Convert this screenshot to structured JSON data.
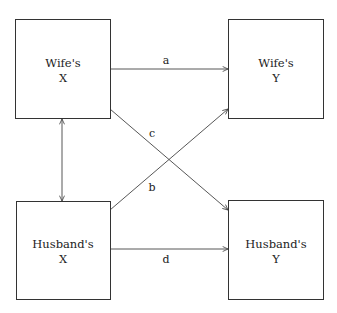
{
  "diagram": {
    "nodes": [
      {
        "id": "wife_x",
        "line1": "Wife's",
        "line2": "X"
      },
      {
        "id": "wife_y",
        "line1": "Wife's",
        "line2": "Y"
      },
      {
        "id": "husband_x",
        "line1": "Husband's",
        "line2": "X"
      },
      {
        "id": "husband_y",
        "line1": "Husband's",
        "line2": "Y"
      }
    ],
    "edges": [
      {
        "id": "a",
        "label": "a",
        "from": "wife_x",
        "to": "wife_y"
      },
      {
        "id": "c",
        "label": "c",
        "from": "wife_x",
        "to": "husband_y"
      },
      {
        "id": "b",
        "label": "b",
        "from": "husband_x",
        "to": "wife_y"
      },
      {
        "id": "d",
        "label": "d",
        "from": "husband_x",
        "to": "husband_y"
      },
      {
        "id": "corr",
        "label": "",
        "from": "wife_x",
        "to": "husband_x",
        "bidirectional": true
      }
    ]
  }
}
